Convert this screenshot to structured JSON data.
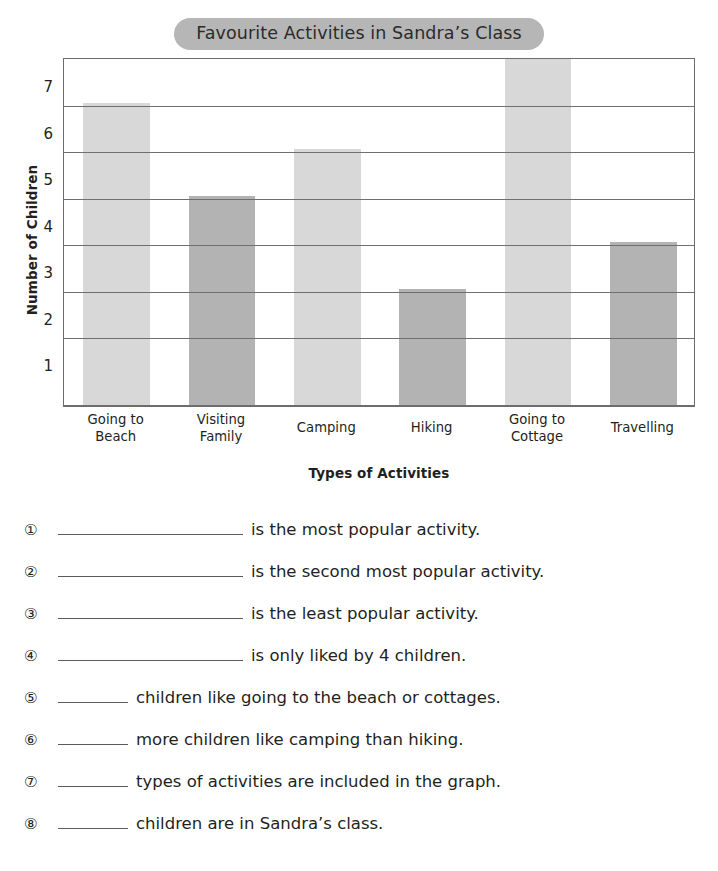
{
  "worksheet": {
    "title": "Favourite Activities in Sandra’s Class"
  },
  "chart_data": {
    "type": "bar",
    "title": "Favourite Activities in Sandra’s Class",
    "xlabel": "Types of Activities",
    "ylabel": "Number of Children",
    "categories": [
      "Going to Beach",
      "Visiting Family",
      "Camping",
      "Hiking",
      "Going to Cottage",
      "Travelling"
    ],
    "category_lines": [
      [
        "Going to",
        "Beach"
      ],
      [
        "Visiting",
        "Family"
      ],
      [
        "Camping"
      ],
      [
        "Hiking"
      ],
      [
        "Going to",
        "Cottage"
      ],
      [
        "Travelling"
      ]
    ],
    "values": [
      6,
      4,
      5,
      2,
      7,
      3
    ],
    "bar_colors": [
      "#d8d8d8",
      "#b3b3b3",
      "#d8d8d8",
      "#b3b3b3",
      "#d8d8d8",
      "#b3b3b3"
    ],
    "ylim": [
      0,
      7.5
    ],
    "ytick_labels": [
      "1",
      "2",
      "3",
      "4",
      "5",
      "6",
      "7"
    ],
    "ytick_values": [
      1,
      2,
      3,
      4,
      5,
      6,
      7
    ],
    "gridline_values": [
      1.5,
      2.5,
      3.5,
      4.5,
      5.5,
      6.5
    ],
    "grid": true,
    "legend": "none",
    "axis_color": "#6d6d6d",
    "grid_color": "#6f6f6f",
    "title_pill_color": "#b6b6b6"
  },
  "questions": [
    {
      "num": "①",
      "blank": "long",
      "text": "is the most popular activity."
    },
    {
      "num": "②",
      "blank": "long",
      "text": "is the second most popular activity."
    },
    {
      "num": "③",
      "blank": "long",
      "text": "is the least popular activity."
    },
    {
      "num": "④",
      "blank": "long",
      "text": "is only liked by 4 children."
    },
    {
      "num": "⑤",
      "blank": "short",
      "text": "children like going to the beach or cottages."
    },
    {
      "num": "⑥",
      "blank": "short",
      "text": "more children like camping than hiking."
    },
    {
      "num": "⑦",
      "blank": "short",
      "text": "types of activities are included in the graph."
    },
    {
      "num": "⑧",
      "blank": "short",
      "text": "children are in Sandra’s class."
    }
  ]
}
